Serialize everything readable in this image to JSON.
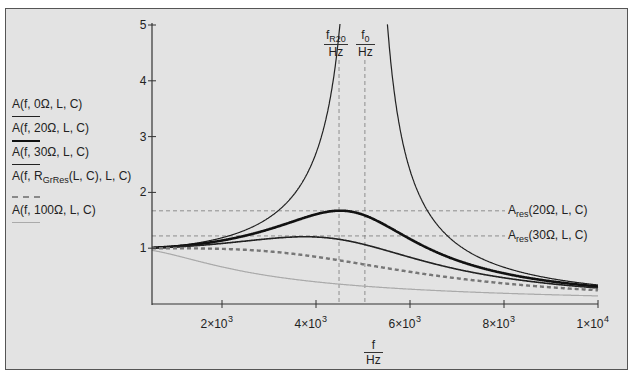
{
  "legend": {
    "items": [
      {
        "label": "A(f, 0Ω, L, C)",
        "style": "thin-black"
      },
      {
        "label": "A(f, 20Ω, L, C)",
        "style": "thick-black"
      },
      {
        "label": "A(f, 30Ω, L, C)",
        "style": "medium-black"
      },
      {
        "label_main": "A(f, R",
        "label_sub": "GrRes",
        "label_tail": "(L, C), L, C)",
        "style": "dashed-gray"
      },
      {
        "label": "A(f, 100Ω, L, C)",
        "style": "thin-lightgray"
      }
    ]
  },
  "markers": {
    "fR20": {
      "num_main": "f",
      "num_sub": "R20",
      "den": "Hz"
    },
    "f0": {
      "num_main": "f",
      "num_sub": "0",
      "den": "Hz"
    },
    "ares20": {
      "main": "A",
      "sub": "res",
      "tail": "(20Ω, L, C)"
    },
    "ares30": {
      "main": "A",
      "sub": "res",
      "tail": "(30Ω, L, C)"
    }
  },
  "axes": {
    "xlabel_num": "f",
    "xlabel_den": "Hz",
    "x_ticks": [
      {
        "value": 2000,
        "base": "2×10",
        "exp": "3"
      },
      {
        "value": 4000,
        "base": "4×10",
        "exp": "3"
      },
      {
        "value": 6000,
        "base": "6×10",
        "exp": "3"
      },
      {
        "value": 8000,
        "base": "8×10",
        "exp": "3"
      },
      {
        "value": 10000,
        "base": "1×10",
        "exp": "4"
      }
    ],
    "y_ticks": [
      "1",
      "2",
      "3",
      "4",
      "5"
    ]
  },
  "chart_data": {
    "type": "line",
    "title": "",
    "xlabel": "f / Hz",
    "ylabel": "A",
    "xlim": [
      510,
      10000
    ],
    "ylim": [
      0,
      5
    ],
    "grid": false,
    "legend_position": "left-outside",
    "f0_hz": 5040,
    "fR20_hz": 4490,
    "Ares_20": 1.67,
    "Ares_30": 1.22,
    "series": [
      {
        "name": "A(f, 0Ω, L, C)",
        "damping": 0.0,
        "color": "#222222",
        "width": 1.2,
        "dash": ""
      },
      {
        "name": "A(f, 20Ω, L, C)",
        "damping": 0.315,
        "color": "#111111",
        "width": 2.6,
        "dash": ""
      },
      {
        "name": "A(f, 30Ω, L, C)",
        "damping": 0.47,
        "color": "#222222",
        "width": 1.6,
        "dash": ""
      },
      {
        "name": "A(f, R_GrRes(L, C), L, C)",
        "damping": 0.7071,
        "color": "#777777",
        "width": 2.4,
        "dash": "4,3"
      },
      {
        "name": "A(f, 100Ω, L, C)",
        "damping": 1.57,
        "color": "#aaaaaa",
        "width": 1.2,
        "dash": ""
      }
    ],
    "sample_points": {
      "x": [
        510,
        2000,
        4000,
        4490,
        5040,
        6000,
        8000,
        10000
      ],
      "A_20ohm": [
        1.01,
        1.15,
        1.56,
        1.67,
        1.58,
        1.04,
        0.55,
        0.31
      ],
      "A_30ohm": [
        1.01,
        1.13,
        1.22,
        1.2,
        1.06,
        0.83,
        0.5,
        0.29
      ],
      "A_GrRes": [
        1.0,
        1.0,
        0.85,
        0.78,
        0.71,
        0.58,
        0.37,
        0.25
      ],
      "A_100ohm": [
        0.98,
        0.8,
        0.48,
        0.43,
        0.39,
        0.33,
        0.25,
        0.2
      ]
    }
  }
}
